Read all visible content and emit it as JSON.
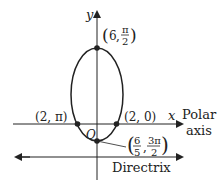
{
  "diagram": {
    "type": "polar-conic-ellipse",
    "axes": {
      "y_label": "y",
      "x_label": "x",
      "polar_axis_label_line1": "Polar",
      "polar_axis_label_line2": "axis",
      "origin_label": "O"
    },
    "directrix_label": "Directrix",
    "points": [
      {
        "name": "top",
        "r": "6",
        "theta_num": "π",
        "theta_den": "2"
      },
      {
        "name": "left",
        "label": "(2, π)"
      },
      {
        "name": "right",
        "label": "(2, 0)"
      },
      {
        "name": "bottom",
        "r_num": "6",
        "r_den": "5",
        "theta_num": "3π",
        "theta_den": "2"
      }
    ],
    "colors": {
      "stroke": "#222222",
      "background": "#ffffff"
    }
  }
}
